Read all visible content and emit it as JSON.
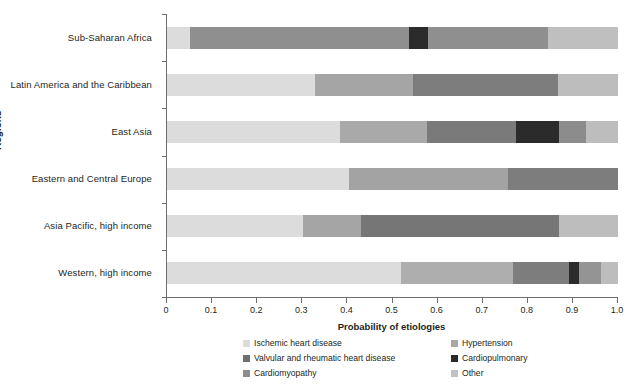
{
  "axes": {
    "y_title": "Regions",
    "x_title": "Probability of etiologies",
    "x_ticks": [
      "0",
      "0.1",
      "0.2",
      "0.3",
      "0.4",
      "0.5",
      "0.6",
      "0.7",
      "0.8",
      "0.9",
      "1.0"
    ]
  },
  "legend": {
    "items": [
      {
        "label": "Ischemic heart disease",
        "color": "#dcdcdc"
      },
      {
        "label": "Hypertension",
        "color": "#a8a8a8"
      },
      {
        "label": "Valvular and rheumatic heart disease",
        "color": "#6f6f6f"
      },
      {
        "label": "Cardiopulmonary",
        "color": "#2b2b2b"
      },
      {
        "label": "Cardiomyopathy",
        "color": "#8c8c8c"
      },
      {
        "label": "Other",
        "color": "#c2c2c2"
      }
    ]
  },
  "chart_data": {
    "type": "bar",
    "orientation": "horizontal",
    "stacked": true,
    "title": "",
    "xlabel": "Probability of etiologies",
    "ylabel": "Regions",
    "xlim": [
      0,
      1.0
    ],
    "grid": false,
    "legend_position": "bottom",
    "categories": [
      "Sub-Saharan Africa",
      "Latin America and the Caribbean",
      "East Asia",
      "Eastern and Central Europe",
      "Asia Pacific, high income",
      "Western, high income"
    ],
    "series": [
      {
        "name": "Ischemic heart disease",
        "color": "#dcdcdc",
        "values": [
          0.05,
          0.328,
          0.384,
          0.403,
          0.302,
          0.519
        ]
      },
      {
        "name": "Hypertension",
        "color": "#a8a8a8",
        "values": [
          0.0,
          0.0,
          0.0,
          0.0,
          0.128,
          0.248
        ]
      },
      {
        "name": "Cardiomyopathy",
        "color": "#8c8c8c",
        "values": [
          0.487,
          0.217,
          0.193,
          0.353,
          0.0,
          0.0
        ]
      },
      {
        "name": "Valvular and rheumatic heart disease",
        "color": "#6f6f6f",
        "values": [
          0.0,
          0.322,
          0.197,
          0.244,
          0.44,
          0.124
        ]
      },
      {
        "name": "Cardiopulmonary",
        "color": "#2b2b2b",
        "values": [
          0.042,
          0.0,
          0.095,
          0.0,
          0.0,
          0.022
        ]
      },
      {
        "name": "Other",
        "color": "#c2c2c2",
        "values": [
          0.421,
          0.133,
          0.131,
          0.0,
          0.13,
          0.087
        ]
      }
    ],
    "bars": [
      {
        "category": "Sub-Saharan Africa",
        "segments": [
          {
            "series": "Ischemic heart disease",
            "start": 0.0,
            "end": 0.05,
            "color": "#dcdcdc"
          },
          {
            "series": "Cardiomyopathy",
            "start": 0.05,
            "end": 0.537,
            "color": "#8f8f8f"
          },
          {
            "series": "Cardiopulmonary",
            "start": 0.537,
            "end": 0.579,
            "color": "#2b2b2b"
          },
          {
            "series": "Valvular and rheumatic heart disease",
            "start": 0.579,
            "end": 0.845,
            "color": "#8f8f8f"
          },
          {
            "series": "Other",
            "start": 0.845,
            "end": 1.0,
            "color": "#bfbfbf"
          }
        ]
      },
      {
        "category": "Latin America and the Caribbean",
        "segments": [
          {
            "series": "Ischemic heart disease",
            "start": 0.0,
            "end": 0.328,
            "color": "#dcdcdc"
          },
          {
            "series": "Cardiomyopathy",
            "start": 0.328,
            "end": 0.545,
            "color": "#a5a5a5"
          },
          {
            "series": "Valvular and rheumatic heart disease",
            "start": 0.545,
            "end": 0.867,
            "color": "#7d7d7d"
          },
          {
            "series": "Other",
            "start": 0.867,
            "end": 1.0,
            "color": "#bdbdbd"
          }
        ]
      },
      {
        "category": "East Asia",
        "segments": [
          {
            "series": "Ischemic heart disease",
            "start": 0.0,
            "end": 0.384,
            "color": "#dcdcdc"
          },
          {
            "series": "Cardiomyopathy",
            "start": 0.384,
            "end": 0.577,
            "color": "#a9a9a9"
          },
          {
            "series": "Valvular and rheumatic heart disease",
            "start": 0.577,
            "end": 0.774,
            "color": "#7a7a7a"
          },
          {
            "series": "Cardiopulmonary",
            "start": 0.774,
            "end": 0.869,
            "color": "#2b2b2b"
          },
          {
            "series": "Hypertension",
            "start": 0.869,
            "end": 0.929,
            "color": "#8c8c8c"
          },
          {
            "series": "Other",
            "start": 0.929,
            "end": 1.0,
            "color": "#bdbdbd"
          }
        ]
      },
      {
        "category": "Eastern and Central Europe",
        "segments": [
          {
            "series": "Ischemic heart disease",
            "start": 0.0,
            "end": 0.403,
            "color": "#dcdcdc"
          },
          {
            "series": "Cardiomyopathy",
            "start": 0.403,
            "end": 0.756,
            "color": "#a3a3a3"
          },
          {
            "series": "Valvular and rheumatic heart disease",
            "start": 0.756,
            "end": 1.0,
            "color": "#7d7d7d"
          }
        ]
      },
      {
        "category": "Asia Pacific, high income",
        "segments": [
          {
            "series": "Ischemic heart disease",
            "start": 0.0,
            "end": 0.302,
            "color": "#dcdcdc"
          },
          {
            "series": "Hypertension",
            "start": 0.302,
            "end": 0.43,
            "color": "#a5a5a5"
          },
          {
            "series": "Valvular and rheumatic heart disease",
            "start": 0.43,
            "end": 0.87,
            "color": "#767676"
          },
          {
            "series": "Other",
            "start": 0.87,
            "end": 1.0,
            "color": "#bdbdbd"
          }
        ]
      },
      {
        "category": "Western, high income",
        "segments": [
          {
            "series": "Ischemic heart disease",
            "start": 0.0,
            "end": 0.519,
            "color": "#dcdcdc"
          },
          {
            "series": "Hypertension",
            "start": 0.519,
            "end": 0.767,
            "color": "#aeaeae"
          },
          {
            "series": "Valvular and rheumatic heart disease",
            "start": 0.767,
            "end": 0.891,
            "color": "#7d7d7d"
          },
          {
            "series": "Cardiopulmonary",
            "start": 0.891,
            "end": 0.913,
            "color": "#2b2b2b"
          },
          {
            "series": "Cardiomyopathy",
            "start": 0.913,
            "end": 0.962,
            "color": "#949494"
          },
          {
            "series": "Other",
            "start": 0.962,
            "end": 1.0,
            "color": "#bdbdbd"
          }
        ]
      }
    ]
  }
}
